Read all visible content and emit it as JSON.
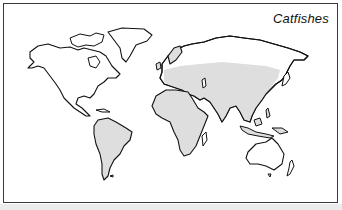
{
  "figure": {
    "title": "Catfishes",
    "type": "distribution-map",
    "colors": {
      "frame": "#3a3a3a",
      "outline": "#111111",
      "range_fill": "#dedede",
      "land_fill": "#ffffff",
      "background": "#ffffff"
    }
  },
  "legend": {
    "shaded_meaning": "catfish distribution range"
  },
  "regions": [
    {
      "name": "North America",
      "shaded": false
    },
    {
      "name": "Central America",
      "shaded": false
    },
    {
      "name": "South America",
      "shaded": true
    },
    {
      "name": "Greenland",
      "shaded": false
    },
    {
      "name": "Europe",
      "shaded": true
    },
    {
      "name": "Africa",
      "shaded": true
    },
    {
      "name": "Madagascar",
      "shaded": false
    },
    {
      "name": "Asia (temperate band, south & southeast)",
      "shaded": true
    },
    {
      "name": "Siberia / northern Asia",
      "shaded": false
    },
    {
      "name": "Australia",
      "shaded": false
    },
    {
      "name": "New Zealand",
      "shaded": false
    }
  ]
}
